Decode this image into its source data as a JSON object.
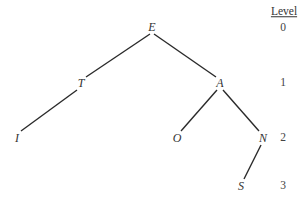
{
  "diagram": {
    "type": "binary-tree",
    "line_color": "#2a2a2a",
    "text_color": "#333333",
    "nodes": [
      {
        "id": "E",
        "label": "E",
        "level": 0,
        "x": 152,
        "y": 27
      },
      {
        "id": "T",
        "label": "T",
        "level": 1,
        "x": 81,
        "y": 83
      },
      {
        "id": "A",
        "label": "A",
        "level": 1,
        "x": 220,
        "y": 83
      },
      {
        "id": "I",
        "label": "I",
        "level": 2,
        "x": 17,
        "y": 138
      },
      {
        "id": "O",
        "label": "O",
        "level": 2,
        "x": 177,
        "y": 138
      },
      {
        "id": "N",
        "label": "N",
        "level": 2,
        "x": 263,
        "y": 138
      },
      {
        "id": "S",
        "label": "S",
        "level": 3,
        "x": 241,
        "y": 186
      }
    ],
    "edges": [
      {
        "from": "E",
        "to": "T"
      },
      {
        "from": "E",
        "to": "A"
      },
      {
        "from": "T",
        "to": "I"
      },
      {
        "from": "A",
        "to": "O"
      },
      {
        "from": "A",
        "to": "N"
      },
      {
        "from": "N",
        "to": "S"
      }
    ],
    "level_column": {
      "header": "Level",
      "levels": [
        "0",
        "1",
        "2",
        "3"
      ]
    }
  }
}
